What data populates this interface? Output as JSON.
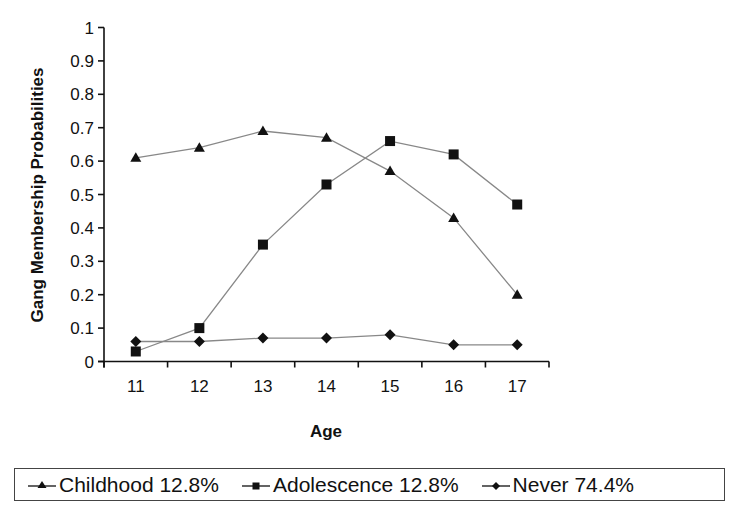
{
  "chart_data": {
    "type": "line",
    "title": "",
    "xlabel": "Age",
    "ylabel": "Gang Membership Probabilities",
    "categories": [
      "11",
      "12",
      "13",
      "14",
      "15",
      "16",
      "17"
    ],
    "ylim": [
      0,
      1
    ],
    "yticks": [
      "0",
      "0.1",
      "0.2",
      "0.3",
      "0.4",
      "0.5",
      "0.6",
      "0.7",
      "0.8",
      "0.9",
      "1"
    ],
    "grid": false,
    "legend_position": "bottom",
    "series": [
      {
        "name": "Childhood 12.8%",
        "marker": "triangle",
        "values": [
          0.61,
          0.64,
          0.69,
          0.67,
          0.57,
          0.43,
          0.2
        ]
      },
      {
        "name": "Adolescence 12.8%",
        "marker": "square",
        "values": [
          0.03,
          0.1,
          0.35,
          0.53,
          0.66,
          0.62,
          0.47
        ]
      },
      {
        "name": "Never 74.4%",
        "marker": "diamond",
        "values": [
          0.06,
          0.06,
          0.07,
          0.07,
          0.08,
          0.05,
          0.05
        ]
      }
    ],
    "colors": {
      "line": "#888888",
      "marker": "#111111",
      "axis": "#111111"
    }
  },
  "legend": {
    "items": [
      {
        "label": "Childhood 12.8%",
        "marker": "triangle"
      },
      {
        "label": "Adolescence 12.8%",
        "marker": "square"
      },
      {
        "label": "Never 74.4%",
        "marker": "diamond"
      }
    ]
  }
}
